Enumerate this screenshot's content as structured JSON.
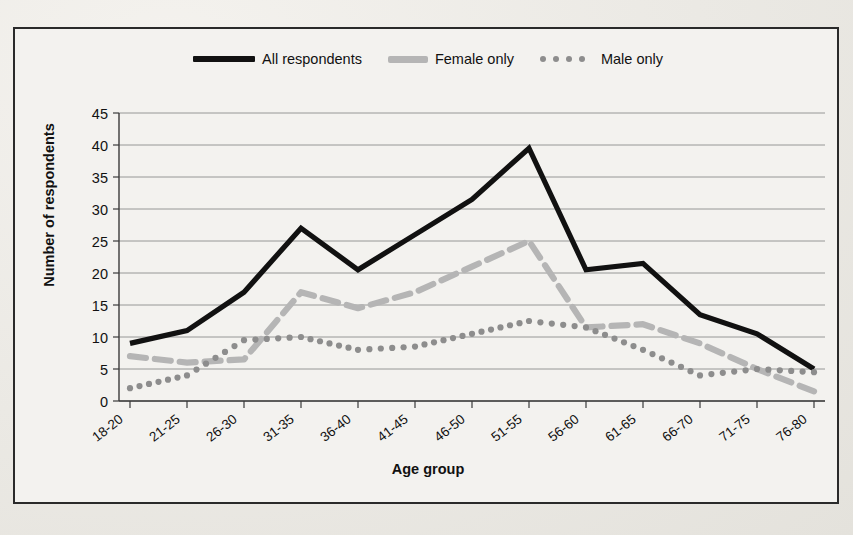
{
  "chart_data": {
    "type": "line",
    "title": "",
    "xlabel": "Age group",
    "ylabel": "Number of respondents",
    "ylim": [
      0,
      45
    ],
    "ytick_step": 5,
    "yticks": [
      "0",
      "5",
      "10",
      "15",
      "20",
      "25",
      "30",
      "35",
      "40",
      "45"
    ],
    "grid": true,
    "legend_position": "top-center",
    "categories": [
      "18-20",
      "21-25",
      "26-30",
      "31-35",
      "36-40",
      "41-45",
      "46-50",
      "51-55",
      "56-60",
      "61-65",
      "66-70",
      "71-75",
      "76-80"
    ],
    "series": [
      {
        "name": "All respondents",
        "style": "solid",
        "color": "#111111",
        "values": [
          9,
          11,
          17,
          27,
          20.5,
          26,
          31.5,
          39.5,
          20.5,
          21.5,
          13.5,
          10.5,
          5
        ]
      },
      {
        "name": "Female only",
        "style": "dashed",
        "color": "#b5b5b5",
        "values": [
          7,
          6,
          6.5,
          17,
          14.5,
          17,
          21,
          25,
          11.5,
          12,
          9,
          5,
          1.5
        ]
      },
      {
        "name": "Male only",
        "style": "dotted",
        "color": "#8d8d8d",
        "values": [
          2,
          4,
          9.5,
          10,
          8,
          8.5,
          10.5,
          12.5,
          11.5,
          8,
          4,
          5,
          4.5
        ]
      }
    ]
  },
  "legend": {
    "items": [
      {
        "label": "All respondents",
        "swatch": "solid-line-swatch"
      },
      {
        "label": "Female only",
        "swatch": "dashed-line-swatch"
      },
      {
        "label": "Male only",
        "swatch": "dotted-line-swatch"
      }
    ]
  },
  "axes": {
    "y_title": "Number of respondents",
    "x_title": "Age group"
  }
}
